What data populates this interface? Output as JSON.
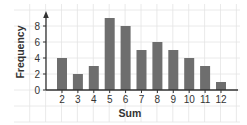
{
  "chart_data": {
    "type": "bar",
    "title": "",
    "xlabel": "Sum",
    "ylabel": "Frequency",
    "categories": [
      "2",
      "3",
      "4",
      "5",
      "6",
      "7",
      "8",
      "9",
      "10",
      "11",
      "12"
    ],
    "values": [
      4,
      2,
      3,
      9,
      8,
      5,
      6,
      5,
      4,
      3,
      1
    ],
    "y_ticks": [
      0,
      2,
      4,
      6,
      8
    ],
    "ylim": [
      0,
      9.5
    ],
    "grid": true,
    "legend": null,
    "colors": {
      "bar": "#6e6e6e",
      "axis": "#333333",
      "grid": "#e4e4e4",
      "text": "#333333",
      "background": "#ffffff"
    }
  }
}
